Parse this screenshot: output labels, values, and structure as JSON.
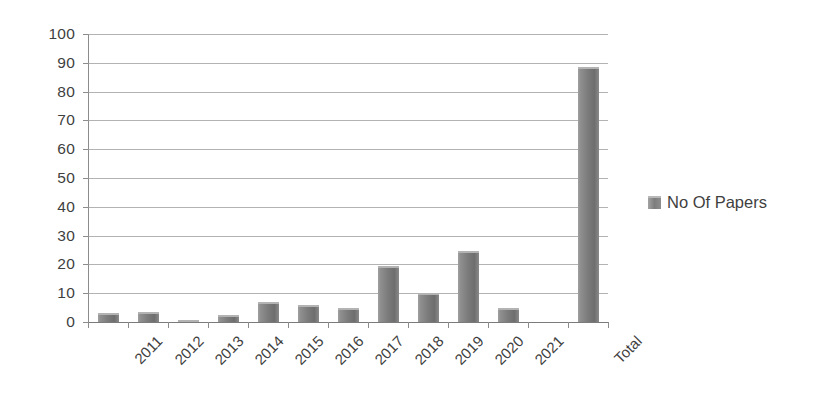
{
  "chart_data": {
    "type": "bar",
    "title": "",
    "subtitle": "",
    "xlabel": "",
    "ylabel": "",
    "categories": [
      "2011",
      "2012",
      "2013",
      "2014",
      "2015",
      "2016",
      "2017",
      "2018",
      "2019",
      "2020",
      "2021",
      "",
      "Total"
    ],
    "series": [
      {
        "name": "No Of Papers",
        "values": [
          3,
          3.5,
          0.5,
          2.5,
          7,
          6,
          5,
          19.5,
          10,
          24.5,
          5,
          null,
          88.5
        ]
      }
    ],
    "ylim": [
      0,
      100
    ],
    "ytick_values": [
      0,
      10,
      20,
      30,
      40,
      50,
      60,
      70,
      80,
      90,
      100
    ],
    "ytick_labels": [
      "0",
      "10",
      "20",
      "30",
      "40",
      "50",
      "60",
      "70",
      "80",
      "90",
      "100"
    ],
    "grid": true,
    "grid_axis": "y",
    "legend_position": "right",
    "legend_entries": [
      "No Of Papers"
    ],
    "bar_color": "#7c7c7c",
    "grid_color": "#9a9a9a",
    "axis_color": "#8c8c8c",
    "text_color": "#3f3f3f",
    "xtick_rotation": -45
  },
  "legend": {
    "marker_name": "legend-color-swatch",
    "label": "No Of Papers"
  }
}
